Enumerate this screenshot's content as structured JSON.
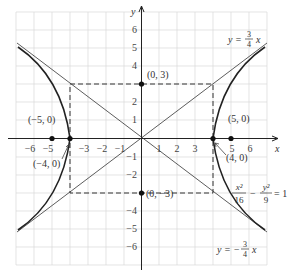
{
  "diagram": {
    "type": "hyperbola-graph",
    "equation": {
      "num1": "x²",
      "den1": "16",
      "minus": "−",
      "num2": "y²",
      "den2": "9",
      "rhs": "= 1"
    },
    "asymptote_upper": {
      "lhs": "y =",
      "num": "3",
      "den": "4",
      "var": "x"
    },
    "asymptote_lower": {
      "lhs": "y = −",
      "num": "3",
      "den": "4",
      "var": "x"
    },
    "axes": {
      "x_label": "x",
      "y_label": "y"
    },
    "x_ticks": [
      "−6",
      "−5",
      "−4",
      "−3",
      "−2",
      "−1",
      "1",
      "2",
      "3",
      "4",
      "5",
      "6"
    ],
    "y_ticks": [
      "6",
      "5",
      "4",
      "3",
      "2",
      "1",
      "−1",
      "−2",
      "−3",
      "−4",
      "−5",
      "−6"
    ],
    "points": {
      "top": "(0, 3)",
      "bottom": "(0, −3)",
      "focus_right": "(5, 0)",
      "focus_left": "(−5, 0)",
      "vertex_right": "(4, 0)",
      "vertex_left": "(−4, 0)"
    },
    "colors": {
      "curve": "#222222",
      "grid": "#d9d9d9",
      "axis": "#222222"
    }
  }
}
